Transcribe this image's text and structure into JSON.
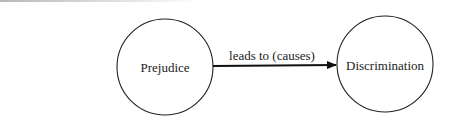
{
  "diagram": {
    "nodes": [
      {
        "id": "prejudice",
        "label": "Prejudice"
      },
      {
        "id": "discrimination",
        "label": "Discrimination"
      }
    ],
    "edges": [
      {
        "from": "prejudice",
        "to": "discrimination",
        "label": "leads to (causes)"
      }
    ]
  },
  "colors": {
    "stroke": "#222222",
    "background": "#ffffff"
  }
}
